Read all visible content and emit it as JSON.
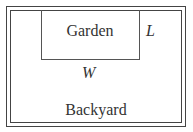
{
  "diagram": {
    "labels": {
      "garden": "Garden",
      "length": "L",
      "width": "W",
      "backyard": "Backyard"
    }
  }
}
